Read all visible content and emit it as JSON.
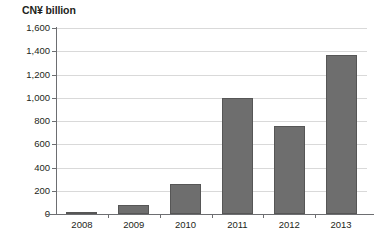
{
  "chart_data": {
    "type": "bar",
    "title": "CN¥ billion",
    "xlabel": "",
    "ylabel": "",
    "categories": [
      "2008",
      "2009",
      "2010",
      "2011",
      "2012",
      "2013"
    ],
    "values": [
      20,
      80,
      260,
      1000,
      760,
      1370
    ],
    "ytick_labels": [
      "0",
      "200",
      "400",
      "600",
      "800",
      "1,000",
      "1,200",
      "1,400",
      "1,600"
    ],
    "ytick_values": [
      0,
      200,
      400,
      600,
      800,
      1000,
      1200,
      1400,
      1600
    ],
    "ylim": [
      0,
      1600
    ],
    "grid": true,
    "legend": "none",
    "series": [
      {
        "name": "CN¥ billion",
        "values": [
          20,
          80,
          260,
          1000,
          760,
          1370
        ],
        "color": "#6e6e6e"
      }
    ],
    "colors": {
      "bar_fill": "#6e6e6e",
      "bar_stroke": "#565656",
      "gridline": "#d9d9d9",
      "axis": "#6d6e71",
      "text": "#231f20",
      "background": "#ffffff"
    }
  }
}
